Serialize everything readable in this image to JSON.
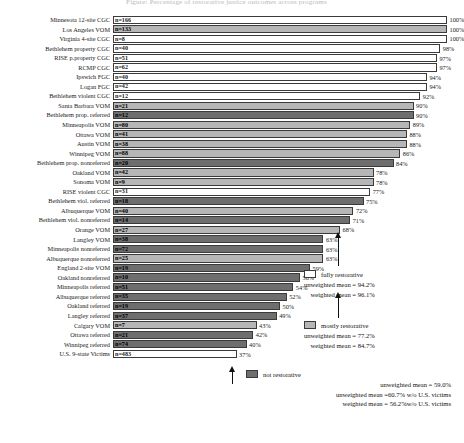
{
  "chart_data": {
    "type": "bar",
    "title": "Figure: Percentage of restorative justice outcomes across programs",
    "xlabel": "",
    "ylabel": "",
    "xlim": [
      0,
      100
    ],
    "grid": false,
    "orientation": "horizontal",
    "legend_position": "right",
    "value_suffix": "%",
    "categories": [
      "Minnesota 12-site CGC",
      "Los Angeles VOM",
      "Virginia 4-site CGC",
      "Bethlehem property CGC",
      "RISE p.property CGC",
      "RCMP CGC",
      "Ipswich FGC",
      "Logan FGC",
      "Bethlehem violent CGC",
      "Santa Barbara VOM",
      "Bethlehem prop. referred",
      "Minneapolis VOM",
      "Ottawa VOM",
      "Austin VOM",
      "Winnipeg VOM",
      "Bethlehem prop. nonreferred",
      "Oakland VOM",
      "Sonoma VOM",
      "RISE violent CGC",
      "Bethlehem viol. referred",
      "Albuquerque VOM",
      "Bethlehem viol. nonreferred",
      "Orange VOM",
      "Langley VOM",
      "Minneapolis nonreferred",
      "Albuquerque nonreferred",
      "England 2-site VOM",
      "Oakland nonreferred",
      "Minneapolis referred",
      "Albuquerque referred",
      "Oakland referred",
      "Langley referred",
      "Calgary VOM",
      "Ottawa referred",
      "Winnipeg referred",
      "U.S. 9-state Victims"
    ],
    "values": [
      100,
      100,
      100,
      98,
      97,
      97,
      94,
      94,
      92,
      90,
      90,
      89,
      88,
      88,
      86,
      84,
      78,
      78,
      77,
      75,
      72,
      71,
      68,
      63,
      63,
      63,
      59,
      56,
      54,
      52,
      50,
      49,
      43,
      42,
      40,
      37
    ],
    "n_labels": [
      "n=166",
      "n=133",
      "n=8",
      "n=40",
      "n=51",
      "n=62",
      "n=40",
      "n=42",
      "n=12",
      "n=21",
      "n=12",
      "n=80",
      "n=41",
      "n=38",
      "n=88",
      "n=20",
      "n=42",
      "n=9",
      "n=31",
      "n=18",
      "n=40",
      "n=14",
      "n=27",
      "n=38",
      "n=72",
      "n=25",
      "n=19",
      "n=10",
      "n=51",
      "n=35",
      "n=19",
      "n=37",
      "n=7",
      "n=21",
      "n=74",
      "n=483"
    ],
    "pct_labels": [
      "100%",
      "100%",
      "100%",
      "98%",
      "97%",
      "97%",
      "94%",
      "94%",
      "92%",
      "90%",
      "90%",
      "89%",
      "88%",
      "88%",
      "86%",
      "84%",
      "78%",
      "78%",
      "77%",
      "75%",
      "72%",
      "71%",
      "68%",
      "63%",
      "63%",
      "63%",
      "59%",
      "56%",
      "54%",
      "52%",
      "50%",
      "49%",
      "43%",
      "42%",
      "40%",
      "37%"
    ],
    "series_class": [
      "full",
      "mostly",
      "full",
      "full",
      "full",
      "full",
      "full",
      "full",
      "full",
      "mostly",
      "not",
      "mostly",
      "mostly",
      "mostly",
      "mostly",
      "not",
      "mostly",
      "mostly",
      "full",
      "not",
      "mostly",
      "not",
      "mostly",
      "not",
      "not",
      "mostly",
      "not",
      "not",
      "not",
      "not",
      "not",
      "not",
      "mostly",
      "not",
      "not",
      "full"
    ],
    "series": [
      {
        "name": "fully restorative",
        "color": "#ffffff"
      },
      {
        "name": "mostly restorative",
        "color": "#b6b6b6"
      },
      {
        "name": "not restorative",
        "color": "#6e6e6e"
      }
    ]
  },
  "legend": {
    "fully": {
      "label": "fully restorative",
      "unweighted": "unweighted mean = 94.2%",
      "weighted": "weighted mean = 96.1%"
    },
    "mostly": {
      "label": "mostly restorative",
      "unweighted": "unweighted mean = 77.2%",
      "weighted": "weighted mean = 84.7%"
    },
    "not": {
      "label": "not restorative",
      "unweighted": "unweighted mean = 59.0%",
      "unweighted_alt": "unweighted mean =60.7% w/o U.S. victims",
      "weighted": "weighted mean =    56.2%w/o U.S. victims"
    }
  }
}
